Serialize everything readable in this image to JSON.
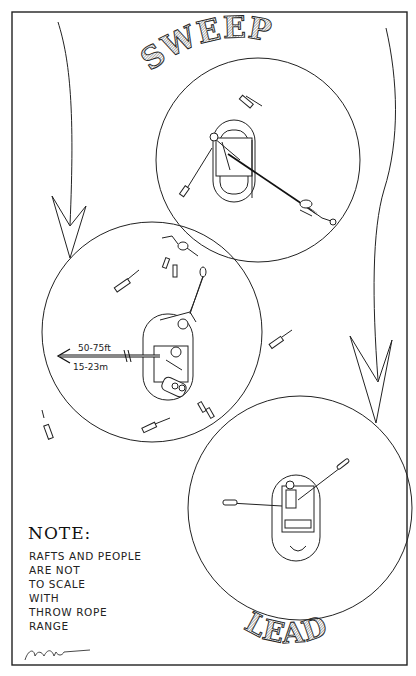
{
  "title_top": "SWEEP",
  "title_bottom": "LEAD",
  "note": {
    "heading": "NOTE:",
    "lines": [
      "RAFTS AND PEOPLE",
      "ARE NOT",
      "TO SCALE",
      "WITH",
      "THROW ROPE",
      "RANGE"
    ]
  },
  "range_label": {
    "feet": "50-75ft",
    "meters": "15-23m"
  },
  "signature": "Artist signature",
  "colors": {
    "ink": "#1a1a1a",
    "paper": "#ffffff"
  },
  "diagram": {
    "circles": [
      {
        "name": "sweep-range-circle",
        "cx": 258,
        "cy": 160,
        "r": 102
      },
      {
        "name": "middle-range-circle",
        "cx": 152,
        "cy": 332,
        "r": 110
      },
      {
        "name": "lead-range-circle",
        "cx": 300,
        "cy": 508,
        "r": 112
      }
    ]
  }
}
